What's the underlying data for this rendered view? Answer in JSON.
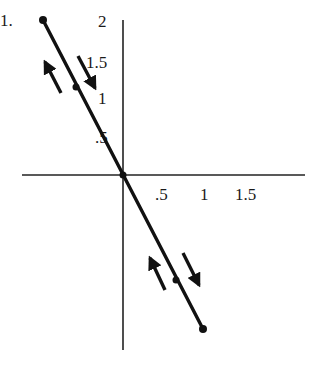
{
  "figure": {
    "label_prefix": "1.",
    "y_axis": {
      "ticks": [
        "2",
        "1.5",
        "1",
        ".5"
      ]
    },
    "x_axis": {
      "ticks": [
        ".5",
        "1",
        "1.5"
      ]
    },
    "line": {
      "description": "straight line through origin with negative slope, with endpoints and two marked points",
      "points": [
        {
          "name": "top-endpoint"
        },
        {
          "name": "upper-point"
        },
        {
          "name": "origin"
        },
        {
          "name": "lower-point"
        },
        {
          "name": "bottom-endpoint"
        }
      ]
    },
    "arrows": [
      {
        "name": "upper-left-arrow",
        "direction": "up-left"
      },
      {
        "name": "upper-right-arrow",
        "direction": "down-right"
      },
      {
        "name": "lower-left-arrow",
        "direction": "up-left"
      },
      {
        "name": "lower-right-arrow",
        "direction": "down-right"
      }
    ],
    "colors": {
      "ink": "#111111",
      "background": "#ffffff"
    }
  }
}
